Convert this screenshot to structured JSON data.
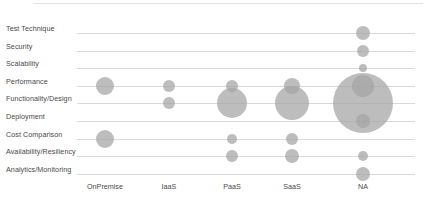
{
  "chart_data": {
    "type": "scatter",
    "title": "",
    "subtitle": "",
    "xlabel": "",
    "ylabel": "",
    "grid": true,
    "legend": "none",
    "bubble_color": "#a3a3a3",
    "gridline_color": "#d9d9d9",
    "label_color": "#4a4a4a",
    "categories": [
      "OnPremise",
      "IaaS",
      "PaaS",
      "SaaS",
      "NA"
    ],
    "y_categories": [
      "Test Technique",
      "Security",
      "Scalability",
      "Performance",
      "Functionality/Design",
      "Deployment",
      "Cost Comparison",
      "Availability/Resiliency",
      "Analytics/Monitoring"
    ],
    "points": [
      {
        "x": "OnPremise",
        "y": "Performance",
        "size": 9
      },
      {
        "x": "OnPremise",
        "y": "Cost Comparison",
        "size": 9
      },
      {
        "x": "IaaS",
        "y": "Performance",
        "size": 6
      },
      {
        "x": "IaaS",
        "y": "Functionality/Design",
        "size": 6
      },
      {
        "x": "PaaS",
        "y": "Performance",
        "size": 6
      },
      {
        "x": "PaaS",
        "y": "Functionality/Design",
        "size": 15
      },
      {
        "x": "PaaS",
        "y": "Cost Comparison",
        "size": 5
      },
      {
        "x": "PaaS",
        "y": "Availability/Resiliency",
        "size": 6
      },
      {
        "x": "SaaS",
        "y": "Performance",
        "size": 8
      },
      {
        "x": "SaaS",
        "y": "Functionality/Design",
        "size": 17
      },
      {
        "x": "SaaS",
        "y": "Cost Comparison",
        "size": 6
      },
      {
        "x": "SaaS",
        "y": "Availability/Resiliency",
        "size": 7
      },
      {
        "x": "NA",
        "y": "Test Technique",
        "size": 7
      },
      {
        "x": "NA",
        "y": "Security",
        "size": 6
      },
      {
        "x": "NA",
        "y": "Scalability",
        "size": 4
      },
      {
        "x": "NA",
        "y": "Performance",
        "size": 11
      },
      {
        "x": "NA",
        "y": "Functionality/Design",
        "size": 30
      },
      {
        "x": "NA",
        "y": "Deployment",
        "size": 7
      },
      {
        "x": "NA",
        "y": "Availability/Resiliency",
        "size": 5
      },
      {
        "x": "NA",
        "y": "Analytics/Monitoring",
        "size": 7
      }
    ]
  }
}
